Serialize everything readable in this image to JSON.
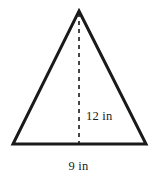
{
  "figure": {
    "kind": "geometry-diagram",
    "shape": "triangle",
    "background_color": "#ffffff",
    "stroke_color": "#1a1a1a",
    "stroke_width": 3,
    "dash_color": "#1a1a1a",
    "dash_width": 1.6,
    "dash_pattern": "4 4",
    "text_color": "#1c1c1c",
    "vertices": {
      "apex": {
        "x": 79,
        "y": 11
      },
      "base_left": {
        "x": 13,
        "y": 144
      },
      "base_right": {
        "x": 146,
        "y": 144
      }
    },
    "height_line": {
      "x": 79,
      "y_top": 11,
      "y_bottom": 144
    },
    "labels": {
      "height": "12 in",
      "base": "9 in"
    }
  }
}
